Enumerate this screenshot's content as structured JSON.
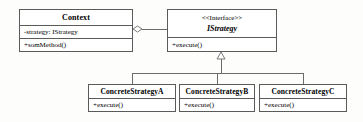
{
  "diagram": {
    "type": "uml-class-diagram",
    "pattern": "Strategy",
    "background_color": "#fdfdfc",
    "line_color": "#6b6b6b",
    "border_color": "#5a5a5a"
  },
  "context_class": {
    "name": "Context",
    "attributes": [
      "-strategy: IStrategy"
    ],
    "operations": [
      "+somMethod()"
    ]
  },
  "interface_class": {
    "stereotype": "<<Interface>>",
    "name": "IStrategy",
    "operations": [
      "+execute()"
    ]
  },
  "concrete_classes": [
    {
      "name": "ConcreteStrategyA",
      "operations": [
        "+execute()"
      ]
    },
    {
      "name": "ConcreteStrategyB",
      "operations": [
        "+execute()"
      ]
    },
    {
      "name": "ConcreteStrategyC",
      "operations": [
        "+execute()"
      ]
    }
  ],
  "relationships": [
    {
      "kind": "aggregation",
      "from": "Context",
      "to": "IStrategy",
      "marker": "open-diamond"
    },
    {
      "kind": "generalization",
      "from": "ConcreteStrategyA",
      "to": "IStrategy",
      "marker": "hollow-triangle"
    },
    {
      "kind": "generalization",
      "from": "ConcreteStrategyB",
      "to": "IStrategy",
      "marker": "hollow-triangle"
    },
    {
      "kind": "generalization",
      "from": "ConcreteStrategyC",
      "to": "IStrategy",
      "marker": "hollow-triangle"
    }
  ]
}
